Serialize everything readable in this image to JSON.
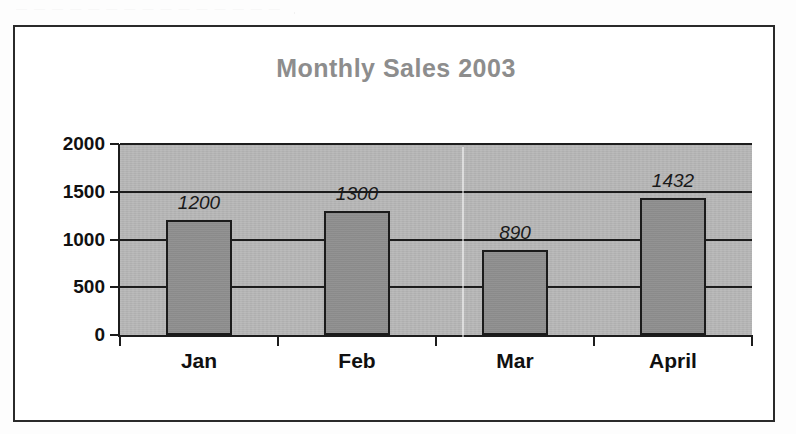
{
  "page": {
    "background_color": "#fdfdfd",
    "frame_border_color": "#2a2a2a",
    "cutoff_text": "— — — — — — — — — — — — — — —"
  },
  "chart_data": {
    "type": "bar",
    "title": "Monthly Sales 2003",
    "xlabel": "",
    "ylabel": "",
    "categories": [
      "Jan",
      "Feb",
      "Mar",
      "April"
    ],
    "values": [
      1200,
      1300,
      890,
      1432
    ],
    "data_labels": [
      "1200",
      "1300",
      "890",
      "1432"
    ],
    "ylim": [
      0,
      2000
    ],
    "ytick_values": [
      0,
      500,
      1000,
      1500,
      2000
    ],
    "ytick_labels": [
      "0",
      "500",
      "1000",
      "1500",
      "2000"
    ],
    "grid": true,
    "grid_axis": "y",
    "legend": false,
    "legend_position": "none",
    "colors": {
      "title": "#8d8d8d",
      "plot_background": "#b6b6b6",
      "bar_fill": "#8e8e8e",
      "bar_outline": "#1b1b1b",
      "gridline": "#1c1c1c",
      "axis": "#1c1c1c",
      "tick_label": "#111111",
      "data_label": "#1a1a1a",
      "category_label": "#101010"
    }
  }
}
